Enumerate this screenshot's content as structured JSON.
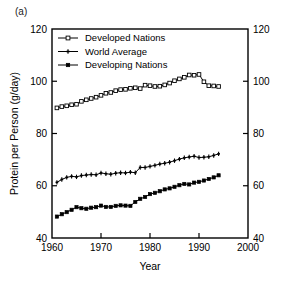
{
  "panel": {
    "label": "(a)"
  },
  "chart_data": {
    "type": "line",
    "title": "",
    "subtitle": "",
    "xlabel": "Year",
    "ylabel": "Protein per Person (g/day)",
    "xlim": [
      1960,
      2000
    ],
    "ylim": [
      40,
      120
    ],
    "xticks": [
      1960,
      1970,
      1980,
      1990,
      2000
    ],
    "xticklabels": [
      "1960",
      "1970",
      "1980",
      "1990",
      "2000"
    ],
    "yticks": [
      40,
      60,
      80,
      100,
      120
    ],
    "yticklabels": [
      "40",
      "60",
      "80",
      "100",
      "120"
    ],
    "right_axis_ticks": [
      40,
      60,
      80,
      100,
      120
    ],
    "right_axis_ticklabels": [
      "40",
      "60",
      "80",
      "100",
      "120"
    ],
    "grid": false,
    "legend_position": "upper-left-inside",
    "x": [
      1961,
      1962,
      1963,
      1964,
      1965,
      1966,
      1967,
      1968,
      1969,
      1970,
      1971,
      1972,
      1973,
      1974,
      1975,
      1976,
      1977,
      1978,
      1979,
      1980,
      1981,
      1982,
      1983,
      1984,
      1985,
      1986,
      1987,
      1988,
      1989,
      1990,
      1991,
      1992,
      1993,
      1994
    ],
    "series": [
      {
        "name": "Developed Nations",
        "marker": "open-square",
        "values": [
          89.8,
          90.3,
          90.6,
          91.0,
          91.2,
          92.3,
          92.9,
          93.4,
          93.9,
          94.6,
          95.4,
          95.7,
          96.4,
          96.8,
          96.9,
          97.3,
          97.5,
          97.2,
          98.5,
          98.3,
          98.0,
          98.1,
          98.6,
          99.3,
          100.2,
          100.9,
          101.5,
          102.4,
          102.3,
          102.6,
          99.8,
          98.3,
          98.2,
          98.0
        ]
      },
      {
        "name": "World Average",
        "marker": "cross",
        "values": [
          61.3,
          62.4,
          63.2,
          63.6,
          63.4,
          63.9,
          64.1,
          64.3,
          64.2,
          64.9,
          64.6,
          64.4,
          64.8,
          65.0,
          64.9,
          65.2,
          65.0,
          67.0,
          67.0,
          67.4,
          67.8,
          68.3,
          68.6,
          69.0,
          69.6,
          70.2,
          70.7,
          71.0,
          71.3,
          70.8,
          70.9,
          71.1,
          71.6,
          72.2
        ]
      },
      {
        "name": "Developing Nations",
        "marker": "filled-square",
        "values": [
          48.2,
          49.1,
          49.9,
          50.8,
          51.8,
          51.4,
          51.2,
          51.6,
          51.8,
          52.4,
          51.9,
          51.9,
          52.3,
          52.5,
          52.4,
          52.3,
          53.8,
          55.0,
          55.7,
          56.8,
          57.3,
          57.9,
          58.6,
          59.0,
          59.6,
          60.2,
          60.7,
          60.5,
          61.2,
          61.5,
          62.0,
          62.6,
          63.2,
          64.0
        ]
      }
    ],
    "legend": [
      {
        "label": "Developed Nations",
        "marker": "open-square"
      },
      {
        "label": "World Average",
        "marker": "cross"
      },
      {
        "label": "Developing Nations",
        "marker": "filled-square"
      }
    ]
  }
}
